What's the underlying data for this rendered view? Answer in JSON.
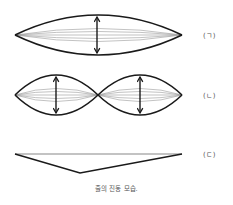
{
  "figure": {
    "caption": "줄의 진동 모습.",
    "panels": [
      {
        "id": "a",
        "label": "(ㄱ)",
        "description": "fundamental mode, one loop",
        "loops": 1
      },
      {
        "id": "b",
        "label": "(ㄴ)",
        "description": "second harmonic, two loops with central node",
        "loops": 2
      },
      {
        "id": "c",
        "label": "(ㄷ)",
        "description": "plucked string initial shape (triangle)",
        "loops": 0
      }
    ],
    "colors": {
      "line": "#1a1a1a",
      "inner_line": "#888888",
      "text": "#555555",
      "background": "#ffffff"
    }
  }
}
